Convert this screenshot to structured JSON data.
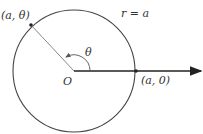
{
  "diagram": {
    "curve_label": "r = a",
    "point_theta_label": "(a, θ)",
    "point_zero_label": "(a, 0)",
    "origin_label": "O",
    "angle_label": "θ",
    "colors": {
      "stroke": "#444444",
      "axis": "#222222",
      "radius": "#888888"
    }
  }
}
